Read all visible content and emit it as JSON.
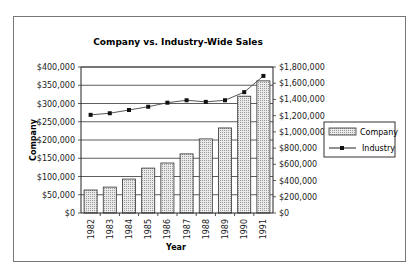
{
  "chart_data": {
    "type": "bar+line",
    "title": "Company vs. Industry-Wide Sales",
    "xlabel": "Year",
    "ylabel": "Company",
    "y2label": "",
    "categories": [
      "1982",
      "1983",
      "1984",
      "1985",
      "1986",
      "1987",
      "1988",
      "1989",
      "1990",
      "1991"
    ],
    "series": [
      {
        "name": "Company",
        "type": "bar",
        "axis": "left",
        "values": [
          63000,
          71000,
          93000,
          123000,
          137000,
          162000,
          203000,
          233000,
          320000,
          362000
        ]
      },
      {
        "name": "Industry",
        "type": "line",
        "axis": "right",
        "values": [
          1210000,
          1230000,
          1270000,
          1310000,
          1360000,
          1390000,
          1370000,
          1390000,
          1490000,
          1690000
        ]
      }
    ],
    "ylim": [
      0,
      400000
    ],
    "y2lim": [
      0,
      1800000
    ],
    "yticks": [
      "$0",
      "$50,000",
      "$100,000",
      "$150,000",
      "$200,000",
      "$250,000",
      "$300,000",
      "$350,000",
      "$400,000"
    ],
    "y2ticks": [
      "$0",
      "$200,000",
      "$400,000",
      "$600,000",
      "$800,000",
      "$1,000,000",
      "$1,200,000",
      "$1,400,000",
      "$1,600,000",
      "$1,800,000"
    ],
    "grid": true,
    "legend_position": "right"
  },
  "legend": {
    "company": "Company",
    "industry": "Industry"
  }
}
